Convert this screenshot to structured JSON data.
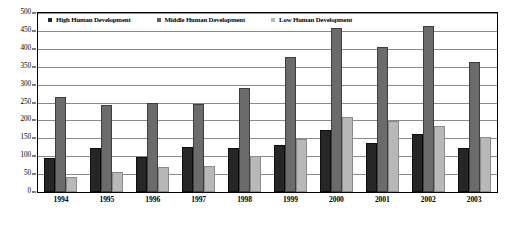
{
  "chart_data": {
    "type": "bar",
    "title": "",
    "xlabel": "",
    "ylabel": "",
    "ylim": [
      0,
      500
    ],
    "ytick_step": 50,
    "yticks": [
      0,
      50,
      100,
      150,
      200,
      250,
      300,
      350,
      400,
      450,
      500
    ],
    "grid": true,
    "legend_position": "top-inside",
    "categories": [
      "1994",
      "1995",
      "1996",
      "1997",
      "1998",
      "1999",
      "2000",
      "2001",
      "2002",
      "2003"
    ],
    "series": [
      {
        "name": "High Human Development",
        "color": "#262626",
        "values": [
          95,
          123,
          97,
          125,
          122,
          130,
          173,
          138,
          161,
          124
        ]
      },
      {
        "name": "Middle Human Development",
        "color": "#6b6b6b",
        "values": [
          265,
          243,
          248,
          247,
          290,
          378,
          457,
          405,
          465,
          364
        ]
      },
      {
        "name": "Low Human Development",
        "color": "#b8b8b8",
        "values": [
          43,
          55,
          70,
          73,
          100,
          147,
          210,
          197,
          185,
          153
        ]
      }
    ]
  },
  "legend": {
    "items": [
      {
        "label": "High Human Development",
        "swatch": "legend-swatch-high"
      },
      {
        "label": "Middle Human Development",
        "swatch": "legend-swatch-middle"
      },
      {
        "label": "Low Human Development",
        "swatch": "legend-swatch-low"
      }
    ]
  }
}
